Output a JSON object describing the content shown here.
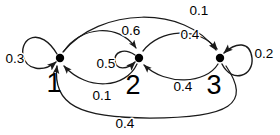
{
  "diagram": {
    "kind": "markov-chain-state-transition-diagram",
    "colors": {
      "background": "#ffffff",
      "stroke": "#1a1a1a",
      "node": "#000000",
      "text": "#000000"
    },
    "nodes": [
      {
        "id": "1",
        "label": "1",
        "x": 60,
        "y": 58,
        "label_x": 54,
        "label_y": 92
      },
      {
        "id": "2",
        "label": "2",
        "x": 139,
        "y": 58,
        "label_x": 133,
        "label_y": 94
      },
      {
        "id": "3",
        "label": "3",
        "x": 220,
        "y": 58,
        "label_x": 214,
        "label_y": 94
      }
    ],
    "edges": [
      {
        "id": "self-1",
        "from": "1",
        "to": "1",
        "weight": "0.3",
        "label_x": 15,
        "label_y": 63,
        "kind": "self-loop",
        "side": "left"
      },
      {
        "id": "self-2",
        "from": "2",
        "to": "2",
        "weight": "0.5",
        "label_x": 106,
        "label_y": 68,
        "kind": "self-loop",
        "side": "left"
      },
      {
        "id": "self-3",
        "from": "3",
        "to": "3",
        "weight": "0.2",
        "label_x": 264,
        "label_y": 58,
        "kind": "self-loop",
        "side": "right"
      },
      {
        "id": "e-1-2",
        "from": "1",
        "to": "2",
        "weight": "0.6",
        "label_x": 131,
        "label_y": 35,
        "kind": "arc",
        "side": "upper"
      },
      {
        "id": "e-2-1",
        "from": "2",
        "to": "1",
        "weight": "0.1",
        "label_x": 102,
        "label_y": 100,
        "kind": "arc",
        "side": "lower"
      },
      {
        "id": "e-2-3",
        "from": "2",
        "to": "3",
        "weight": "0.4",
        "label_x": 190,
        "label_y": 39,
        "kind": "arc",
        "side": "upper"
      },
      {
        "id": "e-3-2",
        "from": "3",
        "to": "2",
        "weight": "0.4",
        "label_x": 183,
        "label_y": 91,
        "kind": "arc",
        "side": "lower"
      },
      {
        "id": "e-1-3",
        "from": "1",
        "to": "3",
        "weight": "0.1",
        "label_x": 199,
        "label_y": 15,
        "kind": "arc",
        "side": "outer-upper"
      },
      {
        "id": "e-3-1",
        "from": "3",
        "to": "1",
        "weight": "0.4",
        "label_x": 125,
        "label_y": 128,
        "kind": "arc",
        "side": "outer-lower"
      }
    ]
  }
}
